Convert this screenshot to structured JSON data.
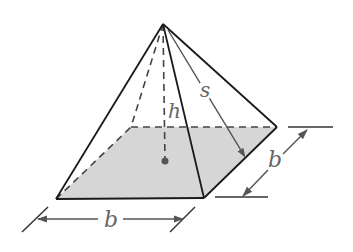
{
  "figure": {
    "labels": {
      "height": "h",
      "slant_height": "s",
      "base_width": "b",
      "base_depth": "b"
    },
    "colors": {
      "line": "#1a1a1a",
      "dashed": "#444444",
      "base_fill": "#d6d6d6",
      "label": "#666666",
      "dimension": "#555555"
    }
  }
}
